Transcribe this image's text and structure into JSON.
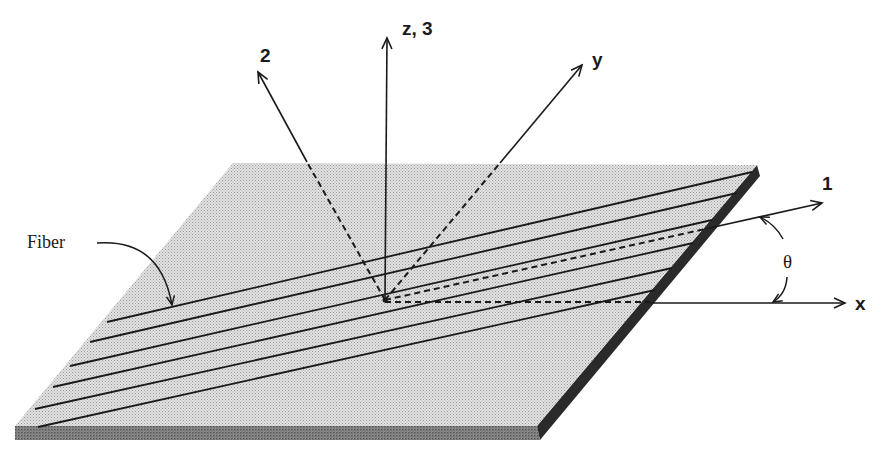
{
  "figure": {
    "type": "diagram",
    "colors": {
      "background": "#ffffff",
      "plate_surface": "#d4d4d4",
      "plate_edge": "#7a7a7a",
      "plate_side": "#2a2a2a",
      "ink": "#1a1a1a"
    }
  },
  "labels": {
    "axis_z3": "z, 3",
    "axis_2": "2",
    "axis_y": "y",
    "axis_1": "1",
    "axis_x": "x",
    "angle": "θ",
    "fiber": "Fiber"
  },
  "axes": [
    {
      "name": "z, 3",
      "style": "solid-above-dashed-none",
      "from": [
        385,
        300
      ],
      "to": [
        387,
        36
      ]
    },
    {
      "name": "2",
      "style": "dashed-below-plate-solid-above",
      "from": [
        385,
        300
      ],
      "to": [
        257,
        70
      ]
    },
    {
      "name": "y",
      "style": "dashed-below-plate-solid-above",
      "from": [
        385,
        300
      ],
      "to": [
        583,
        63
      ]
    },
    {
      "name": "1",
      "style": "dashed-on-plate-solid-off",
      "from": [
        385,
        300
      ],
      "to": [
        823,
        203
      ]
    },
    {
      "name": "x",
      "style": "dashed-on-plate-solid-off",
      "from": [
        385,
        302
      ],
      "to": [
        845,
        303
      ]
    }
  ],
  "fibers": {
    "count": 6,
    "lines": [
      {
        "from": [
          107,
          322
        ],
        "to": [
          757,
          172
        ]
      },
      {
        "from": [
          90,
          342
        ],
        "to": [
          740,
          195
        ]
      },
      {
        "from": [
          70,
          366
        ],
        "to": [
          706,
          225
        ]
      },
      {
        "from": [
          53,
          387
        ],
        "to": [
          690,
          247
        ]
      },
      {
        "from": [
          35,
          409
        ],
        "to": [
          668,
          272
        ]
      },
      {
        "from": [
          38,
          427
        ],
        "to": [
          650,
          292
        ]
      }
    ]
  },
  "plate": {
    "top_face": [
      [
        233,
        163
      ],
      [
        757,
        165
      ],
      [
        537,
        426
      ],
      [
        15,
        426
      ]
    ],
    "front_thickness_px": 14
  }
}
